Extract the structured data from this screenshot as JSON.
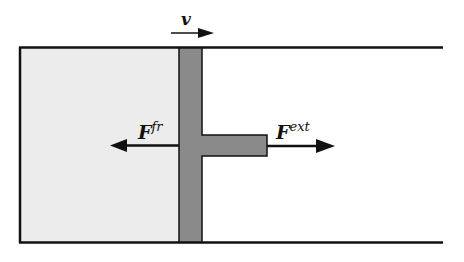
{
  "diagram": {
    "labels": {
      "velocity": "v",
      "friction_force_base": "F",
      "friction_force_sup": "fr",
      "external_force_base": "F",
      "external_force_sup": "ext"
    },
    "colors": {
      "chamber_fill": "#ececec",
      "piston_fill": "#8a8a8a",
      "stroke": "#111111"
    }
  }
}
